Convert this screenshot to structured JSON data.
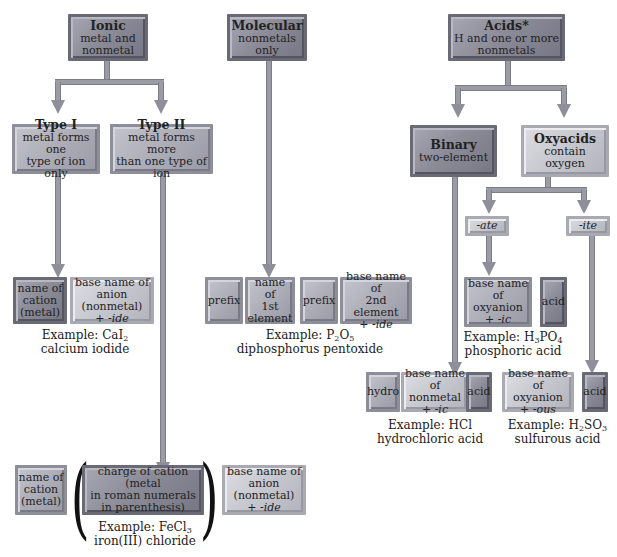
{
  "top": {
    "ionic": {
      "title": "Ionic",
      "line1": "metal and",
      "line2": "nonmetal"
    },
    "molecular": {
      "title": "Molecular",
      "line1": "nonmetals",
      "line2": "only"
    },
    "acids": {
      "title": "Acids*",
      "line1": "H and one or more",
      "line2": "nonmetals"
    }
  },
  "ionic_types": {
    "type1": {
      "title": "Type I",
      "line1": "metal forms one",
      "line2": "type of ion only"
    },
    "type2": {
      "title": "Type II",
      "line1": "metal forms more",
      "line2": "than one type of ion"
    }
  },
  "acid_types": {
    "binary": {
      "title": "Binary",
      "line1": "two-element"
    },
    "oxyacids": {
      "title": "Oxyacids",
      "line1": "contain",
      "line2": "oxygen"
    },
    "ate": "-ate",
    "ite": "-ite"
  },
  "type1_rule": {
    "cation": [
      "name of",
      "cation",
      "(metal)"
    ],
    "anion": [
      "base name of",
      "anion (nonmetal)",
      "+ ",
      "-ide"
    ],
    "example_label": "Example: CaI",
    "example_sub": "2",
    "example_name": "calcium iodide"
  },
  "molecular_rule": {
    "prefix1": "prefix",
    "first": [
      "name of",
      "1st",
      "element"
    ],
    "prefix2": "prefix",
    "second": [
      "base name of",
      "2nd element",
      "+ ",
      "-ide"
    ],
    "example_p": "Example: P",
    "example_sub1": "2",
    "example_o": "O",
    "example_sub2": "5",
    "example_name": "diphosphorus pentoxide"
  },
  "ate_rule": {
    "base": [
      "base name of",
      "oxyanion",
      "+ ",
      "-ic"
    ],
    "acid": "acid",
    "example_h": "Example: H",
    "example_sub1": "3",
    "example_po": "PO",
    "example_sub2": "4",
    "example_name": "phosphoric acid"
  },
  "binary_rule": {
    "hydro": "hydro",
    "base": [
      "base name of",
      "nonmetal + ",
      "-ic"
    ],
    "acid": "acid",
    "example_label": "Example: HCl",
    "example_name": "hydrochloric acid"
  },
  "ite_rule": {
    "base": [
      "base name of",
      "oxyanion",
      "+ ",
      "-ous"
    ],
    "acid": "acid",
    "example_h": "Example: H",
    "example_sub1": "2",
    "example_so": "SO",
    "example_sub2": "3",
    "example_name": "sulfurous acid"
  },
  "type2_rule": {
    "cation": [
      "name of",
      "cation",
      "(metal)"
    ],
    "charge": [
      "charge of cation (metal",
      "in roman numerals",
      "in parenthesis)"
    ],
    "anion": [
      "base name of",
      "anion (nonmetal)",
      "+ ",
      "-ide"
    ],
    "paren_open": "(",
    "paren_close": ")",
    "example_label": "Example: FeCl",
    "example_sub": "3",
    "example_name": "iron(III) chloride"
  }
}
